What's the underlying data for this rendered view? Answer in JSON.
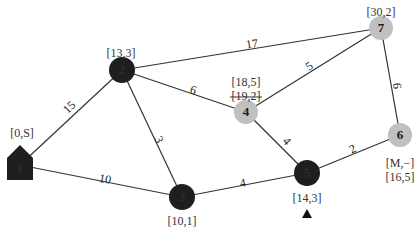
{
  "diagram": {
    "type": "weighted-graph",
    "colors": {
      "visited_node": "#1e1e1e",
      "unvisited_node": "#c0c0c0",
      "edge": "#333333",
      "text": "#222222"
    },
    "nodes": [
      {
        "id": "1",
        "shape": "house",
        "state": "visited",
        "x": 20,
        "y": 165,
        "labels": [
          "[0,S]"
        ],
        "label_pos": [
          22,
          134
        ]
      },
      {
        "id": "2",
        "shape": "circle",
        "state": "visited",
        "x": 122,
        "y": 70,
        "labels": [
          "[13,3]"
        ],
        "label_pos": [
          121,
          54
        ]
      },
      {
        "id": "3",
        "shape": "circle",
        "state": "visited",
        "x": 182,
        "y": 197,
        "labels": [
          "[10,1]"
        ],
        "label_pos": [
          182,
          222
        ]
      },
      {
        "id": "4",
        "shape": "circle",
        "state": "unvisited",
        "x": 246,
        "y": 112,
        "labels": [
          "[18,5]",
          "[19,2]"
        ],
        "strikethrough": [
          false,
          true
        ],
        "label_pos": [
          246,
          83
        ]
      },
      {
        "id": "5",
        "shape": "circle",
        "state": "visited",
        "x": 307,
        "y": 173,
        "labels": [
          "[14,3]"
        ],
        "label_pos": [
          307,
          199
        ],
        "marker": "triangle-up"
      },
      {
        "id": "6",
        "shape": "circle",
        "state": "unvisited",
        "x": 400,
        "y": 135,
        "labels": [
          "[M,−]",
          "[16,5]"
        ],
        "label_pos": [
          400,
          164
        ]
      },
      {
        "id": "7",
        "shape": "circle",
        "state": "unvisited",
        "x": 381,
        "y": 28,
        "labels": [
          "[30,2]"
        ],
        "label_pos": [
          381,
          13
        ]
      }
    ],
    "edges": [
      {
        "from": "1",
        "to": "2",
        "weight": "15",
        "wx": 70,
        "wy": 108,
        "rot": -45
      },
      {
        "from": "1",
        "to": "3",
        "weight": "10",
        "wx": 105,
        "wy": 180,
        "rot": 10
      },
      {
        "from": "2",
        "to": "3",
        "weight": "3",
        "wx": 158,
        "wy": 140,
        "rot": 65
      },
      {
        "from": "2",
        "to": "4",
        "weight": "6",
        "wx": 193,
        "wy": 91,
        "rot": 18
      },
      {
        "from": "2",
        "to": "7",
        "weight": "17",
        "wx": 252,
        "wy": 45,
        "rot": -8
      },
      {
        "from": "4",
        "to": "7",
        "weight": "5",
        "wx": 310,
        "wy": 67,
        "rot": -35
      },
      {
        "from": "4",
        "to": "5",
        "weight": "4",
        "wx": 286,
        "wy": 142,
        "rot": 48
      },
      {
        "from": "3",
        "to": "5",
        "weight": "4",
        "wx": 243,
        "wy": 184,
        "rot": -10
      },
      {
        "from": "5",
        "to": "6",
        "weight": "2",
        "wx": 353,
        "wy": 150,
        "rot": -28
      },
      {
        "from": "7",
        "to": "6",
        "weight": "6",
        "wx": 396,
        "wy": 86,
        "rot": 85
      }
    ]
  }
}
